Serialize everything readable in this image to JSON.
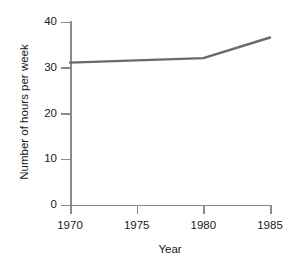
{
  "chart_data": {
    "type": "line",
    "title": "",
    "xlabel": "Year",
    "ylabel": "Number of hours per week",
    "x": [
      1970,
      1980,
      1985
    ],
    "series": [
      {
        "name": "Number of hours per week",
        "values": [
          31,
          32,
          36.5
        ],
        "color": "#6a6a6a"
      }
    ],
    "xlim": [
      1970,
      1985
    ],
    "ylim": [
      0,
      40
    ],
    "xticks": [
      1970,
      1975,
      1980,
      1985
    ],
    "xtick_labels": [
      "1970",
      "1975",
      "1980",
      "1985"
    ],
    "yticks": [
      0,
      10,
      20,
      30,
      40
    ],
    "ytick_labels": [
      "0",
      "10",
      "20",
      "30",
      "40"
    ],
    "grid": false,
    "legend": false,
    "legend_position": "none",
    "axis_color": "#8a8a8a",
    "background_color": "#ffffff"
  }
}
